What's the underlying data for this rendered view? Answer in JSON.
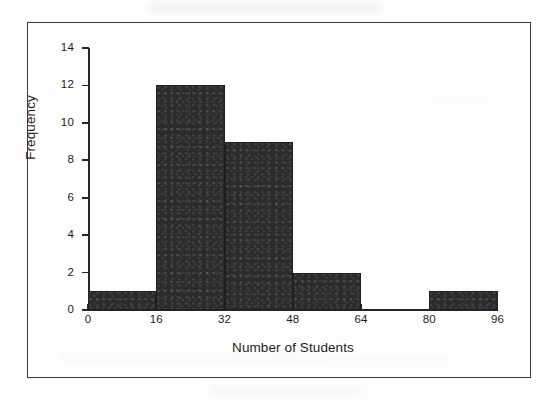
{
  "figure": {
    "frame_color": "#3b3b3e",
    "background_color": "#fdfdfd",
    "bar_color": "#2b2b2d",
    "axis_color": "#26262a",
    "text_color": "#1d1d20"
  },
  "chart_data": {
    "type": "bar",
    "title": "",
    "subtitle": "",
    "xlabel": "Number of Students",
    "ylabel": "Frequency",
    "xlim": [
      0,
      96
    ],
    "ylim": [
      0,
      14
    ],
    "bin_width": 16,
    "grid": false,
    "legend": false,
    "legend_position": "none",
    "x_ticks": [
      0,
      16,
      32,
      48,
      64,
      80,
      96
    ],
    "x_tick_labels": [
      "0",
      "16",
      "32",
      "48",
      "64",
      "80",
      "96"
    ],
    "y_ticks": [
      0,
      2,
      4,
      6,
      8,
      10,
      12,
      14
    ],
    "y_tick_labels": [
      "0",
      "2",
      "4",
      "6",
      "8",
      "10",
      "12",
      "14"
    ],
    "categories": [
      "0-16",
      "16-32",
      "32-48",
      "48-64",
      "64-80",
      "80-96"
    ],
    "bin_edges": [
      0,
      16,
      32,
      48,
      64,
      80,
      96
    ],
    "values": [
      1,
      12,
      9,
      2,
      0,
      1
    ],
    "bars": [
      {
        "label": "0-16",
        "start": 0,
        "end": 16,
        "value": 1
      },
      {
        "label": "16-32",
        "start": 16,
        "end": 32,
        "value": 12
      },
      {
        "label": "32-48",
        "start": 32,
        "end": 48,
        "value": 9
      },
      {
        "label": "48-64",
        "start": 48,
        "end": 64,
        "value": 2
      },
      {
        "label": "64-80",
        "start": 64,
        "end": 80,
        "value": 0
      },
      {
        "label": "80-96",
        "start": 80,
        "end": 96,
        "value": 1
      }
    ],
    "annotations": []
  }
}
